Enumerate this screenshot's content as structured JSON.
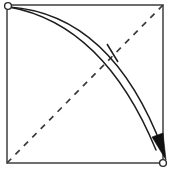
{
  "diagram": {
    "title": "Fold corner to opposite corner",
    "type": "origami-fold-step",
    "canvas": {
      "width": 171,
      "height": 174,
      "background": "#ffffff"
    },
    "sheet": {
      "shape": "square",
      "left": 7,
      "top": 5,
      "right": 163,
      "bottom": 163,
      "stroke_color": "#4a4a4a",
      "fill_color": "#ffffff",
      "stroke_width": 1.6
    },
    "fold_line": {
      "style": "dashed",
      "meaning": "valley-fold",
      "from": {
        "x": 7,
        "y": 163
      },
      "to": {
        "x": 163,
        "y": 5
      },
      "dash_length": 6,
      "dash_gap": 6,
      "stroke_color": "#3a3a3a",
      "stroke_width": 1.7
    },
    "arcs": [
      {
        "name": "outer-motion-arc",
        "path": "M 9 7 Q 112 14 163 150",
        "stroke_color": "#1c1c1c",
        "stroke_width": 1.5
      },
      {
        "name": "inner-motion-arc",
        "path": "M 9 7 Q 104 24 156 150",
        "stroke_color": "#1c1c1c",
        "stroke_width": 1.5
      }
    ],
    "tick_mark": {
      "meaning": "equal-length-marker",
      "from": {
        "x": 107,
        "y": 44
      },
      "to": {
        "x": 118,
        "y": 62
      },
      "stroke_color": "#1c1c1c",
      "stroke_width": 1.5
    },
    "arrow_head": {
      "points": "152,137 166,160 163,133",
      "direction": "down-right",
      "fill_color": "#111111"
    },
    "corner_dots": [
      {
        "name": "start-corner-dot",
        "cx": 8,
        "cy": 6,
        "r": 3.4,
        "position": "top-left"
      },
      {
        "name": "end-corner-dot",
        "cx": 163,
        "cy": 163,
        "r": 3.4,
        "position": "bottom-right"
      }
    ]
  }
}
